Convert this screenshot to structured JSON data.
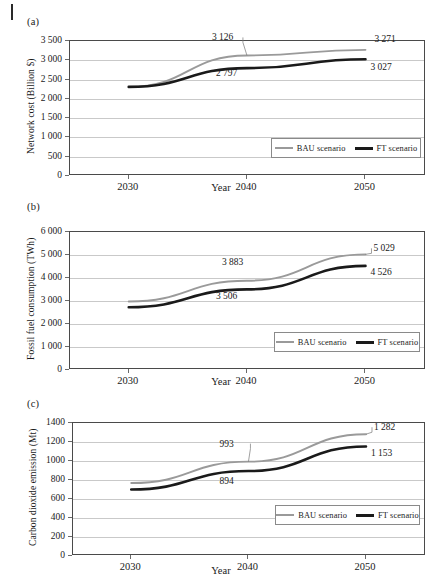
{
  "figure": {
    "page_mark": "page-edge-rule",
    "series_names": {
      "bau": "BAU scenario",
      "ft": "FT scenario"
    },
    "colors": {
      "bau": "#9a9a9a",
      "ft": "#1a1a1a",
      "grid": "#c9c9c9",
      "axis": "#4a4a4a"
    }
  },
  "panels": [
    {
      "letter": "(a)",
      "chart_data": {
        "type": "line",
        "title": "",
        "xlabel": "Year",
        "ylabel": "Network cost (Billion $)",
        "categories": [
          "2030",
          "2040",
          "2050"
        ],
        "x": [
          2030,
          2040,
          2050
        ],
        "ylim": [
          0,
          3500
        ],
        "yticks": [
          "0",
          "500",
          "1 000",
          "1 500",
          "2 000",
          "2 500",
          "3 000",
          "3 500"
        ],
        "ytick_values": [
          0,
          500,
          1000,
          1500,
          2000,
          2500,
          3000,
          3500
        ],
        "grid": true,
        "legend_position": "lower-right",
        "series": [
          {
            "name": "BAU scenario",
            "values": [
              2310,
              3126,
              3271
            ],
            "color": "#9a9a9a"
          },
          {
            "name": "FT scenario",
            "values": [
              2310,
              2797,
              3027
            ],
            "color": "#1a1a1a"
          }
        ],
        "annotations": [
          {
            "text": "3 126",
            "series": "BAU scenario",
            "x": 2040,
            "value": 3126,
            "leader": true
          },
          {
            "text": "3 271",
            "series": "BAU scenario",
            "x": 2050,
            "value": 3271,
            "leader": false
          },
          {
            "text": "2 797",
            "series": "FT scenario",
            "x": 2040,
            "value": 2797,
            "leader": false
          },
          {
            "text": "3 027",
            "series": "FT scenario",
            "x": 2050,
            "value": 3027,
            "leader": false
          }
        ]
      }
    },
    {
      "letter": "(b)",
      "chart_data": {
        "type": "line",
        "title": "",
        "xlabel": "Year",
        "ylabel": "Fossil fuel consumption  (TWh)",
        "categories": [
          "2030",
          "2040",
          "2050"
        ],
        "x": [
          2030,
          2040,
          2050
        ],
        "ylim": [
          0,
          6000
        ],
        "yticks": [
          "0",
          "1 000",
          "2 000",
          "3 000",
          "4 000",
          "5 000",
          "6 000"
        ],
        "ytick_values": [
          0,
          1000,
          2000,
          3000,
          4000,
          5000,
          6000
        ],
        "grid": true,
        "legend_position": "lower-right",
        "series": [
          {
            "name": "BAU scenario",
            "values": [
              2980,
              3883,
              5029
            ],
            "color": "#9a9a9a"
          },
          {
            "name": "FT scenario",
            "values": [
              2730,
              3506,
              4526
            ],
            "color": "#1a1a1a"
          }
        ],
        "annotations": [
          {
            "text": "3 883",
            "series": "BAU scenario",
            "x": 2040,
            "value": 3883,
            "leader": false
          },
          {
            "text": "5 029",
            "series": "BAU scenario",
            "x": 2050,
            "value": 5029,
            "leader": true
          },
          {
            "text": "3 506",
            "series": "FT scenario",
            "x": 2040,
            "value": 3506,
            "leader": false
          },
          {
            "text": "4 526",
            "series": "FT scenario",
            "x": 2050,
            "value": 4526,
            "leader": false
          }
        ]
      }
    },
    {
      "letter": "(c)",
      "chart_data": {
        "type": "line",
        "title": "",
        "xlabel": "Year",
        "ylabel": "Carbon dioxide emission (Mt)",
        "categories": [
          "2030",
          "2040",
          "2050"
        ],
        "x": [
          2030,
          2040,
          2050
        ],
        "ylim": [
          0,
          1400
        ],
        "yticks": [
          "0",
          "200",
          "400",
          "600",
          "800",
          "1000",
          "1200",
          "1400"
        ],
        "ytick_values": [
          0,
          200,
          400,
          600,
          800,
          1000,
          1200,
          1400
        ],
        "grid": true,
        "legend_position": "lower-right",
        "series": [
          {
            "name": "BAU scenario",
            "values": [
              768,
              993,
              1282
            ],
            "color": "#9a9a9a"
          },
          {
            "name": "FT scenario",
            "values": [
              700,
              894,
              1153
            ],
            "color": "#1a1a1a"
          }
        ],
        "annotations": [
          {
            "text": "993",
            "series": "BAU scenario",
            "x": 2040,
            "value": 993,
            "leader": true
          },
          {
            "text": "1 282",
            "series": "BAU scenario",
            "x": 2050,
            "value": 1282,
            "leader": true
          },
          {
            "text": "894",
            "series": "FT scenario",
            "x": 2040,
            "value": 894,
            "leader": false
          },
          {
            "text": "1 153",
            "series": "FT scenario",
            "x": 2050,
            "value": 1153,
            "leader": false
          }
        ]
      }
    }
  ]
}
